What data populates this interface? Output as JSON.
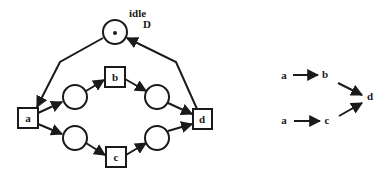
{
  "petri_net": {
    "idle_place": {
      "label": "idle",
      "sublabel": "D",
      "token": true
    },
    "transitions": [
      {
        "id": "a",
        "label": "a"
      },
      {
        "id": "b",
        "label": "b"
      },
      {
        "id": "c",
        "label": "c"
      },
      {
        "id": "d",
        "label": "d"
      }
    ],
    "places": [
      {
        "id": "p_ab"
      },
      {
        "id": "p_ac"
      },
      {
        "id": "p_bd"
      },
      {
        "id": "p_cd"
      }
    ]
  },
  "dependency_graph": {
    "nodes": [
      {
        "label": "a"
      },
      {
        "label": "b"
      },
      {
        "label": "a"
      },
      {
        "label": "c"
      },
      {
        "label": "d"
      }
    ],
    "edges": [
      {
        "from": "a",
        "to": "b"
      },
      {
        "from": "b",
        "to": "d"
      },
      {
        "from": "a",
        "to": "c"
      },
      {
        "from": "c",
        "to": "d"
      }
    ]
  },
  "colors": {
    "stroke": "#1a1a1a",
    "background": "#ffffff"
  }
}
